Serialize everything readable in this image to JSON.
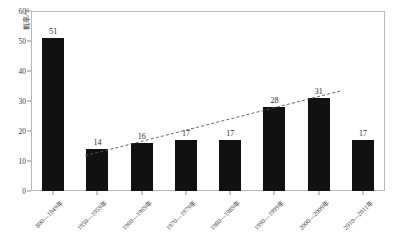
{
  "chart_data": {
    "type": "bar",
    "title": "",
    "xlabel": "",
    "ylabel": "概率/%",
    "ylim": [
      0,
      60
    ],
    "yticks": [
      0,
      10,
      20,
      30,
      40,
      50,
      60
    ],
    "grid": false,
    "legend": "none",
    "categories": [
      "800—1949年",
      "1950—1959年",
      "1960—1969年",
      "1970—1979年",
      "1980—1989年",
      "1990—1999年",
      "2000—2009年",
      "2010—2011年"
    ],
    "values": [
      51,
      14,
      16,
      17,
      17,
      28,
      31,
      17
    ],
    "bar_color": "#111111",
    "annotations": [
      {
        "name": "trend-line",
        "type": "dashed-linear-trend",
        "from": {
          "category_index": 1,
          "value": 12.8
        },
        "to": {
          "category_index": 6,
          "value": 31.5
        },
        "style": "dashed",
        "color": "#555555"
      }
    ]
  },
  "axes": {
    "y_title": "概率/%",
    "y_tick_labels": [
      "0",
      "10",
      "20",
      "30",
      "40",
      "50",
      "60"
    ]
  },
  "bar_labels": [
    "51",
    "14",
    "16",
    "17",
    "17",
    "28",
    "31",
    "17"
  ],
  "x_tick_labels": [
    "800—1949年",
    "1950—1959年",
    "1960—1969年",
    "1970—1979年",
    "1980—1989年",
    "1990—1999年",
    "2000—2009年",
    "2010—2011年"
  ],
  "colors": {
    "bar": "#111111",
    "frame": "#b9b9b9",
    "text": "#3a3a3a",
    "trend": "#555555",
    "background": "#ffffff"
  }
}
